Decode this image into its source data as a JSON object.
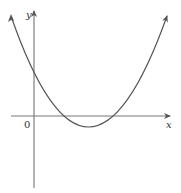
{
  "diagram": {
    "type": "function-graph",
    "axes": {
      "x_label": "x",
      "y_label": "y",
      "origin_label": "0"
    },
    "curve": {
      "shape": "parabola",
      "opens": "up",
      "color": "#555555"
    },
    "colors": {
      "axis": "#555555",
      "curve": "#555555",
      "background": "#ffffff"
    }
  }
}
